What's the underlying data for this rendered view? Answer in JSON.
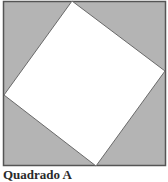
{
  "figure": {
    "caption": "Quadrado A",
    "outer_square": {
      "x": 3,
      "y": 1,
      "size": 163,
      "fill": "#b4b4b4",
      "stroke": "#555555"
    },
    "inner_square": {
      "points": "72,1 165,71 96,166 4,95",
      "fill": "#ffffff",
      "stroke": "#6a6a6a"
    }
  }
}
